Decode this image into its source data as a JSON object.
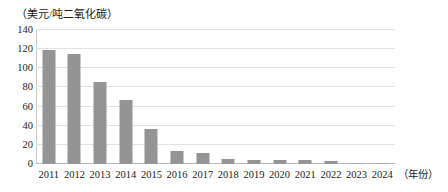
{
  "chart_data": {
    "type": "bar",
    "title": "",
    "subtitle": "",
    "unit_label": "（美元/吨二氧化碳）",
    "xlabel": "（年份）",
    "ylabel": "",
    "categories": [
      "2011",
      "2012",
      "2013",
      "2014",
      "2015",
      "2016",
      "2017",
      "2018",
      "2019",
      "2020",
      "2021",
      "2022",
      "2023",
      "2024"
    ],
    "values": [
      119,
      115,
      86,
      67,
      37,
      14,
      12,
      5,
      4,
      4,
      4,
      3,
      0.4,
      0.3
    ],
    "ylim": [
      0,
      140
    ],
    "ytick_labels": [
      "0",
      "20",
      "40",
      "60",
      "80",
      "100",
      "120",
      "140"
    ],
    "ytick_values": [
      0,
      20,
      40,
      60,
      80,
      100,
      120,
      140
    ],
    "grid": true,
    "legend": "none",
    "bar_color": "#949494",
    "grid_color": "#e2e2e2",
    "axis_color": "#b9b9b9",
    "background_color": "#ffffff"
  }
}
